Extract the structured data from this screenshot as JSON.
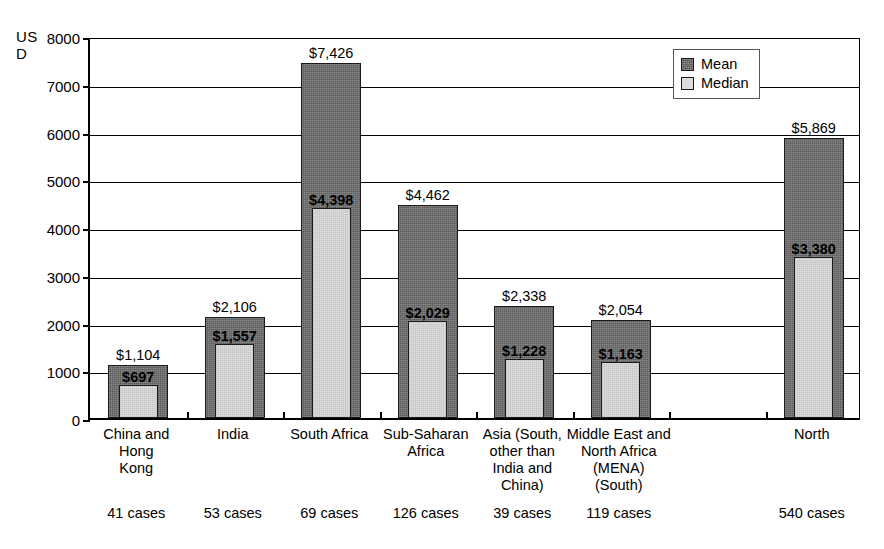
{
  "chart_data": {
    "type": "bar",
    "title": "",
    "subtitle": "",
    "xlabel": "",
    "ylabel": "USD",
    "ylabel_lines": [
      "US",
      "D"
    ],
    "ylim": [
      0,
      8000
    ],
    "ytick_labels": [
      "8000",
      "7000",
      "6000",
      "5000",
      "4000",
      "3000",
      "2000",
      "1000",
      "0"
    ],
    "ytick_values": [
      8000,
      7000,
      6000,
      5000,
      4000,
      3000,
      2000,
      1000,
      0
    ],
    "grid": true,
    "legend_position": "top-right",
    "legend": [
      "Mean",
      "Median"
    ],
    "categories": [
      "China and Hong Kong",
      "India",
      "South Africa",
      "Sub-Saharan Africa",
      "Asia (South, other than India and China)",
      "Middle East and North Africa (MENA) (South)",
      "",
      "North"
    ],
    "category_lines": [
      [
        "China and Hong",
        "Kong"
      ],
      [
        "India"
      ],
      [
        "South Africa"
      ],
      [
        "Sub-Saharan",
        "Africa"
      ],
      [
        "Asia (South,",
        "other than",
        "India and",
        "China)"
      ],
      [
        "Middle East and",
        "North Africa",
        "(MENA)",
        "(South)"
      ],
      [
        ""
      ],
      [
        "North"
      ]
    ],
    "series": [
      {
        "name": "Mean",
        "color": "#5a5a5a",
        "values": [
          1104,
          2106,
          7426,
          4462,
          2338,
          2054,
          null,
          5869
        ],
        "labels": [
          "$1,104",
          "$2,106",
          "$7,426",
          "$4,462",
          "$2,338",
          "$2,054",
          "",
          "$5,869"
        ]
      },
      {
        "name": "Median",
        "color": "#dcdcdc",
        "values": [
          697,
          1557,
          4398,
          2029,
          1228,
          1163,
          null,
          3380
        ],
        "labels": [
          "$697",
          "$1,557",
          "$4,398",
          "$2,029",
          "$1,228",
          "$1,163",
          "",
          "$3,380"
        ]
      }
    ],
    "annotations": {
      "case_counts": [
        "41 cases",
        "53 cases",
        "69 cases",
        "126 cases",
        "39 cases",
        "119 cases",
        "",
        "540 cases"
      ]
    }
  }
}
